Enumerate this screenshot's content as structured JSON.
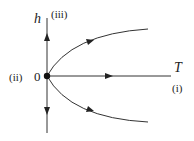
{
  "diagram": {
    "axes": {
      "vertical_label": "h",
      "horizontal_label": "T"
    },
    "origin_label": "0",
    "fixed_point_labels": {
      "top": "(iii)",
      "left": "(ii)",
      "right": "(i)"
    },
    "flows": [
      {
        "name": "flow-up",
        "direction": "up"
      },
      {
        "name": "flow-down",
        "direction": "down"
      },
      {
        "name": "flow-right",
        "direction": "right"
      },
      {
        "name": "flow-upper-curve",
        "direction": "up-right"
      },
      {
        "name": "flow-lower-curve",
        "direction": "down-right"
      }
    ],
    "colors": {
      "line": "#333333",
      "text": "#222222"
    }
  }
}
